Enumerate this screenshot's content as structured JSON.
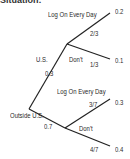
{
  "header": {
    "truncated_title": "Situation:"
  },
  "tree": {
    "root": {
      "branches": [
        {
          "label": "U.S.",
          "probability": "0.3",
          "children": [
            {
              "label": "Log On Every Day",
              "conditional_probability": "2/3",
              "joint_probability": "0.2"
            },
            {
              "label": "Don't",
              "conditional_probability": "1/3",
              "joint_probability": "0.1"
            }
          ]
        },
        {
          "label": "Outside U.S.",
          "probability": "0.7",
          "children": [
            {
              "label": "Log On Every Day",
              "conditional_probability": "3/7",
              "joint_probability": "0.3"
            },
            {
              "label": "Don't",
              "conditional_probability": "4/7",
              "joint_probability": "0.4"
            }
          ]
        }
      ]
    }
  },
  "colors": {
    "line": "#222222",
    "text": "#2a2a2a",
    "background": "#ffffff"
  }
}
